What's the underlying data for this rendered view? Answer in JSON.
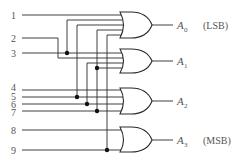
{
  "diagram": {
    "inputs": [
      "1",
      "2",
      "3",
      "4",
      "5",
      "6",
      "7",
      "8",
      "9"
    ],
    "outputs": [
      {
        "name": "A",
        "sub": "0",
        "note": "(LSB)",
        "inputs": [
          "1",
          "3",
          "5",
          "7",
          "9"
        ]
      },
      {
        "name": "A",
        "sub": "1",
        "note": "",
        "inputs": [
          "2",
          "3",
          "6",
          "7"
        ]
      },
      {
        "name": "A",
        "sub": "2",
        "note": "",
        "inputs": [
          "4",
          "5",
          "6",
          "7"
        ]
      },
      {
        "name": "A",
        "sub": "3",
        "note": "(MSB)",
        "inputs": [
          "8",
          "9"
        ]
      }
    ],
    "gate_type": "OR",
    "colors": {
      "line": "#2a2a2a",
      "text": "#555555",
      "background": "#ffffff"
    }
  }
}
